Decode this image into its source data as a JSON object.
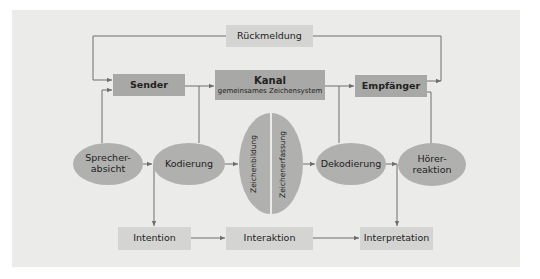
{
  "diagram": {
    "colors": {
      "panel": "#ebebea",
      "dark_box": "#a8a8a6",
      "light_box": "#d4d4d2",
      "ellipse": "#b0b0ae",
      "line": "#6e6e6e"
    },
    "top": {
      "feedback": "Rückmeldung"
    },
    "row1": {
      "sender": "Sender",
      "kanal": {
        "title": "Kanal",
        "subtitle": "gemeinsames Zeichensystem"
      },
      "empfaenger": "Empfänger"
    },
    "row2": {
      "sprecherabsicht": [
        "Sprecher-",
        "absicht"
      ],
      "kodierung": "Kodierung",
      "zeichenbildung": "Zeichenbildung",
      "zeichenerfassung": "Zeichenerfassung",
      "dekodierung": "Dekodierung",
      "hoererreaktion": [
        "Hörer-",
        "reaktion"
      ]
    },
    "row3": {
      "intention": "Intention",
      "interaktion": "Interaktion",
      "interpretation": "Interpretation"
    }
  }
}
